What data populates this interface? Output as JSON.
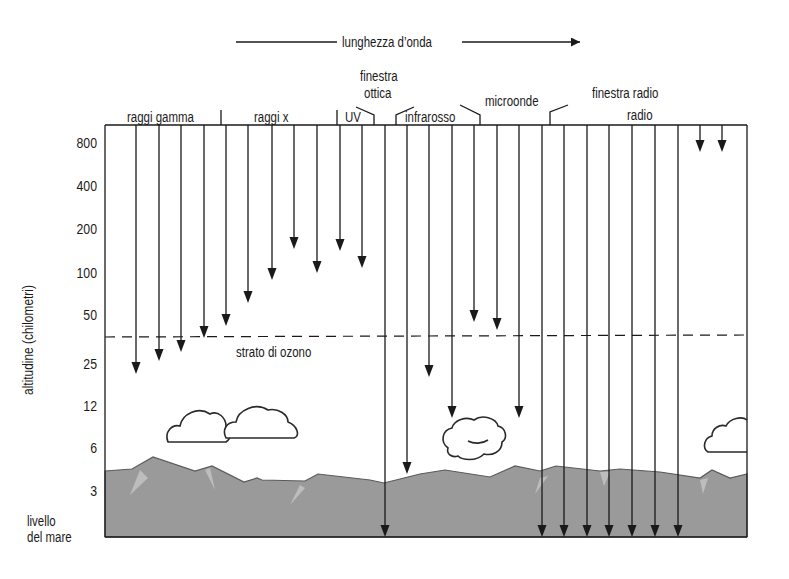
{
  "diagram": {
    "wavelength_axis": {
      "label": "lunghezza d’onda"
    },
    "y_axis": {
      "title": "altitudine (chilometri)",
      "ticks": [
        {
          "label": "800",
          "y": 143
        },
        {
          "label": "400",
          "y": 186
        },
        {
          "label": "200",
          "y": 229
        },
        {
          "label": "100",
          "y": 273
        },
        {
          "label": "50",
          "y": 315
        },
        {
          "label": "25",
          "y": 364
        },
        {
          "label": "12",
          "y": 406
        },
        {
          "label": "6",
          "y": 448
        },
        {
          "label": "3",
          "y": 491
        }
      ],
      "sea_level_label": [
        "livello",
        "del mare"
      ]
    },
    "bands": [
      {
        "label": "raggi gamma"
      },
      {
        "label": "raggi x"
      },
      {
        "label": "UV"
      },
      {
        "label": "finestra ottica",
        "lines": [
          "finestra",
          "ottica"
        ]
      },
      {
        "label": "infrarosso"
      },
      {
        "label": "microonde"
      },
      {
        "label": "finestra radio"
      },
      {
        "label": "radio"
      }
    ],
    "ozone_layer": {
      "label": "strato di ozono",
      "y": 337
    },
    "arrows": [
      {
        "x": 136,
        "end_y": 374
      },
      {
        "x": 159,
        "end_y": 361
      },
      {
        "x": 181,
        "end_y": 352
      },
      {
        "x": 204,
        "end_y": 338
      },
      {
        "x": 226,
        "end_y": 326
      },
      {
        "x": 248,
        "end_y": 303
      },
      {
        "x": 272,
        "end_y": 280
      },
      {
        "x": 294,
        "end_y": 249
      },
      {
        "x": 317,
        "end_y": 273
      },
      {
        "x": 340,
        "end_y": 251
      },
      {
        "x": 362,
        "end_y": 268
      },
      {
        "x": 385,
        "end_y": 537
      },
      {
        "x": 407,
        "end_y": 474
      },
      {
        "x": 429,
        "end_y": 377
      },
      {
        "x": 452,
        "end_y": 418
      },
      {
        "x": 474,
        "end_y": 322
      },
      {
        "x": 497,
        "end_y": 330
      },
      {
        "x": 519,
        "end_y": 418
      },
      {
        "x": 542,
        "end_y": 537
      },
      {
        "x": 564,
        "end_y": 537
      },
      {
        "x": 587,
        "end_y": 537
      },
      {
        "x": 609,
        "end_y": 537
      },
      {
        "x": 632,
        "end_y": 537
      },
      {
        "x": 655,
        "end_y": 537
      },
      {
        "x": 678,
        "end_y": 537
      },
      {
        "x": 700,
        "end_y": 152
      },
      {
        "x": 722,
        "end_y": 152
      }
    ],
    "colors": {
      "ink": "#1a1a1a",
      "mountain": "#9a9a9a",
      "mountain_highlight": "#bdbdbd"
    }
  }
}
